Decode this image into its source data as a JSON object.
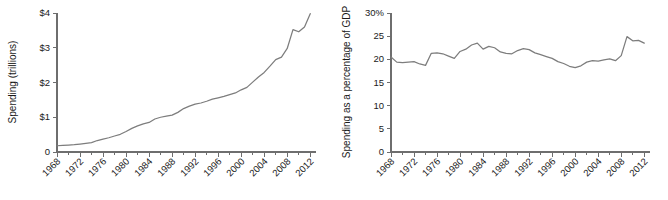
{
  "figure": {
    "background_color": "#ffffff",
    "line_color": "#7d7d7d",
    "axis_color": "#6e6e6e"
  },
  "chart_data": [
    {
      "type": "line",
      "panel": "left",
      "title": "",
      "xlabel": "",
      "ylabel": "Spending (trillions)",
      "xlim": [
        1968,
        2013
      ],
      "ylim": [
        0,
        4
      ],
      "grid": false,
      "legend": "none",
      "ytick_labels": [
        "0",
        "$1",
        "$2",
        "$3",
        "$4"
      ],
      "ytick_values": [
        0,
        1,
        2,
        3,
        4
      ],
      "xtick_labels": [
        "1968",
        "1972",
        "1976",
        "1980",
        "1984",
        "1988",
        "1992",
        "1996",
        "2000",
        "2004",
        "2008",
        "2012"
      ],
      "xtick_values": [
        1968,
        1972,
        1976,
        1980,
        1984,
        1988,
        1992,
        1996,
        2000,
        2004,
        2008,
        2012
      ],
      "minor_xtick_values": [
        1970,
        1974,
        1978,
        1982,
        1986,
        1990,
        1994,
        1998,
        2002,
        2006,
        2010
      ],
      "x": [
        1968,
        1969,
        1970,
        1971,
        1972,
        1973,
        1974,
        1975,
        1976,
        1977,
        1978,
        1979,
        1980,
        1981,
        1982,
        1983,
        1984,
        1985,
        1986,
        1987,
        1988,
        1989,
        1990,
        1991,
        1992,
        1993,
        1994,
        1995,
        1996,
        1997,
        1998,
        1999,
        2000,
        2001,
        2002,
        2003,
        2004,
        2005,
        2006,
        2007,
        2008,
        2009,
        2010,
        2011,
        2012
      ],
      "values": [
        0.18,
        0.19,
        0.2,
        0.21,
        0.23,
        0.25,
        0.27,
        0.33,
        0.37,
        0.41,
        0.46,
        0.51,
        0.59,
        0.68,
        0.75,
        0.81,
        0.85,
        0.95,
        1.0,
        1.03,
        1.06,
        1.14,
        1.25,
        1.32,
        1.38,
        1.41,
        1.46,
        1.52,
        1.56,
        1.6,
        1.65,
        1.7,
        1.79,
        1.86,
        2.01,
        2.16,
        2.29,
        2.47,
        2.66,
        2.73,
        2.98,
        3.52,
        3.46,
        3.6,
        3.98
      ]
    },
    {
      "type": "line",
      "panel": "right",
      "title": "",
      "xlabel": "",
      "ylabel": "Spending as a percentage of GDP",
      "xlim": [
        1968,
        2013
      ],
      "ylim": [
        0,
        30
      ],
      "grid": false,
      "legend": "none",
      "ytick_labels": [
        "0",
        "5",
        "10",
        "15",
        "20",
        "25",
        "30%"
      ],
      "ytick_values": [
        0,
        5,
        10,
        15,
        20,
        25,
        30
      ],
      "xtick_labels": [
        "1968",
        "1972",
        "1976",
        "1980",
        "1984",
        "1988",
        "1992",
        "1996",
        "2000",
        "2004",
        "2008",
        "2012"
      ],
      "xtick_values": [
        1968,
        1972,
        1976,
        1980,
        1984,
        1988,
        1992,
        1996,
        2000,
        2004,
        2008,
        2012
      ],
      "minor_xtick_values": [
        1970,
        1974,
        1978,
        1982,
        1986,
        1990,
        1994,
        1998,
        2002,
        2006,
        2010
      ],
      "x": [
        1968,
        1969,
        1970,
        1971,
        1972,
        1973,
        1974,
        1975,
        1976,
        1977,
        1978,
        1979,
        1980,
        1981,
        1982,
        1983,
        1984,
        1985,
        1986,
        1987,
        1988,
        1989,
        1990,
        1991,
        1992,
        1993,
        1994,
        1995,
        1996,
        1997,
        1998,
        1999,
        2000,
        2001,
        2002,
        2003,
        2004,
        2005,
        2006,
        2007,
        2008,
        2009,
        2010,
        2011,
        2012
      ],
      "values": [
        20.5,
        19.4,
        19.3,
        19.4,
        19.5,
        19.0,
        18.7,
        21.3,
        21.4,
        21.2,
        20.7,
        20.2,
        21.7,
        22.2,
        23.1,
        23.5,
        22.2,
        22.8,
        22.5,
        21.6,
        21.3,
        21.2,
        21.9,
        22.3,
        22.1,
        21.4,
        21.0,
        20.6,
        20.2,
        19.5,
        19.1,
        18.5,
        18.2,
        18.6,
        19.4,
        19.7,
        19.6,
        19.9,
        20.1,
        19.7,
        20.8,
        24.9,
        24.0,
        24.1,
        23.5
      ]
    }
  ]
}
